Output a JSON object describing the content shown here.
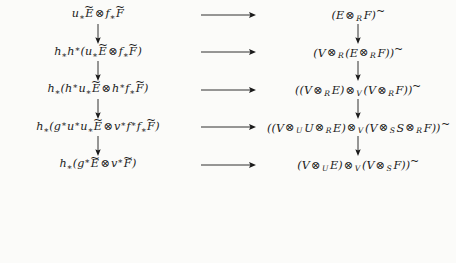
{
  "figure": {
    "kind": "commutative-diagram",
    "background_color": "#fbfbf9",
    "text_color": "#1a1a1a",
    "rows": 5,
    "columns": 2,
    "horizontal_arrow_glyph": "⟶",
    "vertical_arrow_glyph": "↓",
    "nodes": {
      "r1c1": "u∗Ẽ ⊗ f∗F̃",
      "r1c2": "(E ⊗R F)˜",
      "r2c1": "h∗h∗(u∗Ẽ ⊗ f∗F̃)",
      "r2c2": "(V ⊗R (E ⊗R F))˜",
      "r3c1": "h∗(h∗u∗Ẽ ⊗ h∗f∗F̃)",
      "r3c2": "((V ⊗R E) ⊗V (V ⊗R F))˜",
      "r4c1": "h∗(g∗u∗u∗Ẽ ⊗ v∗f∗f∗F̃)",
      "r4c2": "((V ⊗U U ⊗R E) ⊗V (V ⊗S S ⊗R F))˜",
      "r5c1": "h∗(g∗Ẽ ⊗ v∗F̃)",
      "r5c2": "(V ⊗U E) ⊗V (V ⊗S F))˜"
    },
    "symbols": {
      "tensor": "⊗",
      "tilde": "~",
      "lower_star": "∗",
      "upper_star": "∗"
    },
    "subscripts": [
      "R",
      "V",
      "U",
      "S"
    ],
    "letters": [
      "u",
      "E",
      "f",
      "F",
      "h",
      "g",
      "v",
      "V",
      "R",
      "U",
      "S"
    ]
  }
}
